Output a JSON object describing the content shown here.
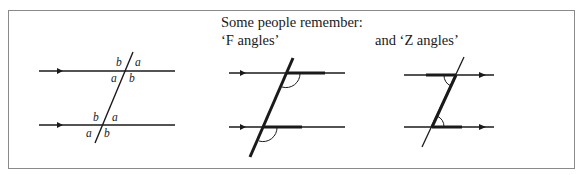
{
  "captions": {
    "intro": "Some people remember:",
    "f_angles": "‘F angles’",
    "z_angles": "and ‘Z angles’"
  },
  "left_diagram": {
    "labels": {
      "top_upper_left": "b",
      "top_upper_right": "a",
      "top_lower_left": "a",
      "top_lower_right": "b",
      "bottom_upper_left": "b",
      "bottom_upper_right": "a",
      "bottom_lower_left": "a",
      "bottom_lower_right": "b"
    }
  },
  "colors": {
    "line": "#1a1a1a",
    "frame": "#8a8a8a"
  }
}
